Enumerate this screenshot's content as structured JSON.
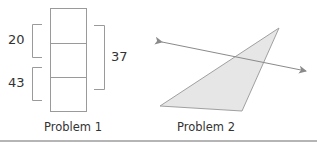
{
  "problem1": {
    "label": "Problem 1",
    "bracket_left_top_value": "20",
    "bracket_left_bottom_value": "43",
    "bracket_right_value": "37",
    "segments": 3
  },
  "problem2": {
    "label": "Problem 2",
    "shape": "triangle",
    "fill_color": "#e6e6e6",
    "line": "double-arrow line crossing triangle"
  },
  "colors": {
    "stroke": "#9a9a9a",
    "text": "#333333",
    "rule": "#b5b5b5"
  }
}
